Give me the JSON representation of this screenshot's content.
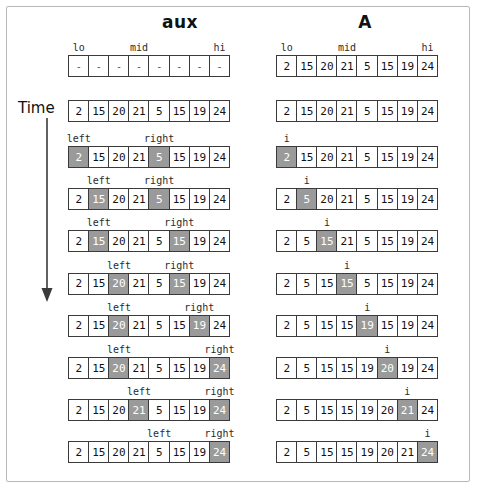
{
  "figure": {
    "type": "merge-sort-merge-trace",
    "time_axis_label": "Time",
    "columns": [
      {
        "key": "aux",
        "title": "aux"
      },
      {
        "key": "A",
        "title": "A"
      }
    ],
    "index_labels": [
      "lo",
      "mid",
      "hi"
    ],
    "lo_index": 0,
    "mid_index": 3,
    "hi_index": 7,
    "pointer_names": {
      "left": "left",
      "right": "right",
      "write": "i"
    },
    "empty_cell": "-",
    "colors": {
      "highlight_fill": "#9a9a9a",
      "highlight_text": "#ffffff",
      "cell_border": "#3a3a3a",
      "frame_border": "#b9b9b9",
      "text": "#111111",
      "background": "#ffffff"
    }
  },
  "aux_header": {
    "labels": [
      {
        "text": "lo",
        "index": 0
      },
      {
        "text": "mid",
        "index": 3
      },
      {
        "text": "hi",
        "index": 7
      }
    ],
    "values": [
      "-",
      "-",
      "-",
      "-",
      "-",
      "-",
      "-",
      "-"
    ]
  },
  "a_header": {
    "labels": [
      {
        "text": "lo",
        "index": 0
      },
      {
        "text": "mid",
        "index": 3
      },
      {
        "text": "hi",
        "index": 7
      }
    ],
    "values": [
      "2",
      "15",
      "20",
      "21",
      "5",
      "15",
      "19",
      "24"
    ]
  },
  "initial": {
    "aux_values": [
      "2",
      "15",
      "20",
      "21",
      "5",
      "15",
      "19",
      "24"
    ],
    "a_values": [
      "2",
      "15",
      "20",
      "21",
      "5",
      "15",
      "19",
      "24"
    ]
  },
  "steps": [
    {
      "step": 1,
      "aux": {
        "values": [
          "2",
          "15",
          "20",
          "21",
          "5",
          "15",
          "19",
          "24"
        ],
        "highlight": [
          0,
          4
        ],
        "labels": [
          {
            "text": "left",
            "index": 0
          },
          {
            "text": "right",
            "index": 4
          }
        ]
      },
      "a": {
        "values": [
          "2",
          "15",
          "20",
          "21",
          "5",
          "15",
          "19",
          "24"
        ],
        "highlight": [
          0
        ],
        "labels": [
          {
            "text": "i",
            "index": 0
          }
        ]
      }
    },
    {
      "step": 2,
      "aux": {
        "values": [
          "2",
          "15",
          "20",
          "21",
          "5",
          "15",
          "19",
          "24"
        ],
        "highlight": [
          1,
          4
        ],
        "labels": [
          {
            "text": "left",
            "index": 1
          },
          {
            "text": "right",
            "index": 4
          }
        ]
      },
      "a": {
        "values": [
          "2",
          "5",
          "20",
          "21",
          "5",
          "15",
          "19",
          "24"
        ],
        "highlight": [
          1
        ],
        "labels": [
          {
            "text": "i",
            "index": 1
          }
        ]
      }
    },
    {
      "step": 3,
      "aux": {
        "values": [
          "2",
          "15",
          "20",
          "21",
          "5",
          "15",
          "19",
          "24"
        ],
        "highlight": [
          1,
          5
        ],
        "labels": [
          {
            "text": "left",
            "index": 1
          },
          {
            "text": "right",
            "index": 5
          }
        ]
      },
      "a": {
        "values": [
          "2",
          "5",
          "15",
          "21",
          "5",
          "15",
          "19",
          "24"
        ],
        "highlight": [
          2
        ],
        "labels": [
          {
            "text": "i",
            "index": 2
          }
        ]
      }
    },
    {
      "step": 4,
      "aux": {
        "values": [
          "2",
          "15",
          "20",
          "21",
          "5",
          "15",
          "19",
          "24"
        ],
        "highlight": [
          2,
          5
        ],
        "labels": [
          {
            "text": "left",
            "index": 2
          },
          {
            "text": "right",
            "index": 5
          }
        ]
      },
      "a": {
        "values": [
          "2",
          "5",
          "15",
          "15",
          "5",
          "15",
          "19",
          "24"
        ],
        "highlight": [
          3
        ],
        "labels": [
          {
            "text": "i",
            "index": 3
          }
        ]
      }
    },
    {
      "step": 5,
      "aux": {
        "values": [
          "2",
          "15",
          "20",
          "21",
          "5",
          "15",
          "19",
          "24"
        ],
        "highlight": [
          2,
          6
        ],
        "labels": [
          {
            "text": "left",
            "index": 2
          },
          {
            "text": "right",
            "index": 6
          }
        ]
      },
      "a": {
        "values": [
          "2",
          "5",
          "15",
          "15",
          "19",
          "15",
          "19",
          "24"
        ],
        "highlight": [
          4
        ],
        "labels": [
          {
            "text": "i",
            "index": 4
          }
        ]
      }
    },
    {
      "step": 6,
      "aux": {
        "values": [
          "2",
          "15",
          "20",
          "21",
          "5",
          "15",
          "19",
          "24"
        ],
        "highlight": [
          2,
          7
        ],
        "labels": [
          {
            "text": "left",
            "index": 2
          },
          {
            "text": "right",
            "index": 7
          }
        ]
      },
      "a": {
        "values": [
          "2",
          "5",
          "15",
          "15",
          "19",
          "20",
          "19",
          "24"
        ],
        "highlight": [
          5
        ],
        "labels": [
          {
            "text": "i",
            "index": 5
          }
        ]
      }
    },
    {
      "step": 7,
      "aux": {
        "values": [
          "2",
          "15",
          "20",
          "21",
          "5",
          "15",
          "19",
          "24"
        ],
        "highlight": [
          3,
          7
        ],
        "labels": [
          {
            "text": "left",
            "index": 3
          },
          {
            "text": "right",
            "index": 7
          }
        ]
      },
      "a": {
        "values": [
          "2",
          "5",
          "15",
          "15",
          "19",
          "20",
          "21",
          "24"
        ],
        "highlight": [
          6
        ],
        "labels": [
          {
            "text": "i",
            "index": 6
          }
        ]
      }
    },
    {
      "step": 8,
      "aux": {
        "values": [
          "2",
          "15",
          "20",
          "21",
          "5",
          "15",
          "19",
          "24"
        ],
        "highlight": [
          7
        ],
        "labels": [
          {
            "text": "left",
            "index": 4
          },
          {
            "text": "right",
            "index": 7
          }
        ]
      },
      "a": {
        "values": [
          "2",
          "5",
          "15",
          "15",
          "19",
          "20",
          "21",
          "24"
        ],
        "highlight": [
          7
        ],
        "labels": [
          {
            "text": "i",
            "index": 7
          }
        ]
      }
    }
  ]
}
